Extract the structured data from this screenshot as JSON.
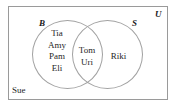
{
  "figure": {
    "type": "venn-diagram",
    "universe_label": "U",
    "set_labels": {
      "left": "B",
      "right": "S"
    },
    "regions": {
      "left_only": {
        "region_name": "B only",
        "members": [
          "Tia",
          "Amy",
          "Pam",
          "Eli"
        ]
      },
      "intersection": {
        "region_name": "B and S",
        "members": [
          "Tom",
          "Uri"
        ]
      },
      "right_only": {
        "region_name": "S only",
        "members": [
          "Riki"
        ]
      },
      "outside": {
        "region_name": "outside both sets",
        "members": [
          "Sue"
        ]
      }
    },
    "colors": {
      "outline": "#9a9a9a",
      "circle_outline": "#a2a2a2",
      "text": "#262626",
      "background": "#ffffff"
    }
  }
}
